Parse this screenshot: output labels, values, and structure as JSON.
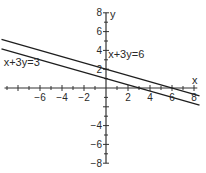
{
  "chart_data": {
    "type": "line",
    "title": "",
    "xlabel": "x",
    "ylabel": "y",
    "xlim": [
      -9.5,
      8.5
    ],
    "ylim": [
      -8,
      8
    ],
    "grid": false,
    "legend": "none",
    "x_ticks": [
      -6,
      -4,
      -2,
      2,
      4,
      6,
      8
    ],
    "y_ticks": [
      8,
      6,
      4,
      2,
      -4,
      -6,
      -8
    ],
    "series": [
      {
        "name": "x+3y=6",
        "equation": "y = (6 - x)/3",
        "x": [
          -9.5,
          0,
          6,
          8.5
        ],
        "values": [
          5.17,
          2,
          0,
          -0.83
        ]
      },
      {
        "name": "x+3y=3",
        "equation": "y = (3 - x)/3",
        "x": [
          -9.5,
          0,
          3,
          8.5
        ],
        "values": [
          4.17,
          1,
          0,
          -1.83
        ]
      }
    ],
    "annotations": [
      {
        "text": "x+3y=6",
        "x": 0.2,
        "y": 3.2
      },
      {
        "text": "x+3y=3",
        "x": -9.3,
        "y": 2.3
      }
    ]
  },
  "colors": {
    "line": "#1e1e1e",
    "axis": "#333333",
    "text": "#2a2a2a"
  }
}
